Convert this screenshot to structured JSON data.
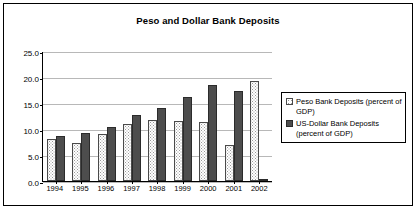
{
  "chart_data": {
    "type": "bar",
    "title": "Peso and Dollar Bank Deposits",
    "xlabel": "",
    "ylabel": "",
    "categories": [
      "1994",
      "1995",
      "1996",
      "1997",
      "1998",
      "1999",
      "2000",
      "2001",
      "2002"
    ],
    "series": [
      {
        "name": "Peso Bank Deposits (percent of GDP)",
        "values": [
          8.0,
          7.4,
          9.0,
          10.9,
          11.8,
          11.6,
          11.4,
          7.0,
          19.3
        ],
        "swatch": "peso"
      },
      {
        "name": "US-Dollar Bank Deposits (percent of GDP)",
        "values": [
          8.7,
          9.2,
          10.4,
          12.6,
          14.1,
          16.2,
          18.4,
          17.4,
          0.4
        ],
        "swatch": "dollar"
      }
    ],
    "ylim": [
      0,
      25
    ],
    "ytick_values": [
      25.0,
      20.0,
      15.0,
      10.0,
      5.0,
      0.0
    ],
    "ytick_labels": [
      "25.0",
      "20.0",
      "15.0",
      "10.0",
      "5.0",
      "0.0"
    ],
    "grid": true,
    "legend_position": "right",
    "colors": {
      "peso_fill": "#ffffff",
      "dollar_fill": "#4d4d4d",
      "grid": "#b8b8b8",
      "axis": "#000000",
      "border": "#000000",
      "background": "#ffffff"
    }
  },
  "legend": {
    "items": [
      {
        "label": "Peso Bank Deposits (percent of GDP)",
        "swatch": "peso"
      },
      {
        "label": "US-Dollar Bank Deposits (percent of GDP)",
        "swatch": "dollar"
      }
    ]
  }
}
